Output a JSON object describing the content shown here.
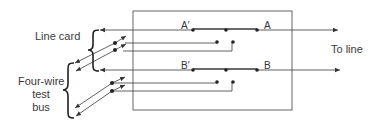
{
  "diagram": {
    "labels": {
      "line_card": "Line card",
      "test_bus_line1": "Four-wire",
      "test_bus_line2": "test",
      "test_bus_line3": "bus",
      "to_line": "To line"
    },
    "contacts": {
      "a_prime": "A′",
      "a": "A",
      "b_prime": "B′",
      "b": "B"
    },
    "colors": {
      "line": "#3a3a3a",
      "box": "#555555",
      "background": "#ffffff"
    }
  }
}
